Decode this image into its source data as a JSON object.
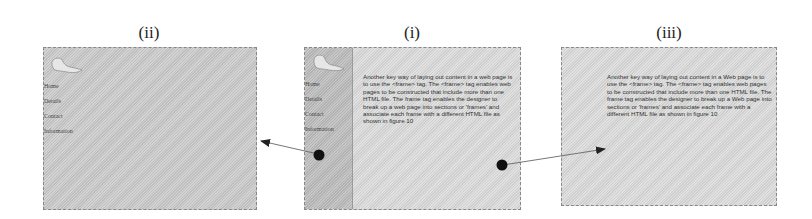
{
  "figure": {
    "panels": [
      {
        "id": "ii",
        "label": "(ii)",
        "nav_links": [
          "Home",
          "Details",
          "Contact",
          "Information"
        ]
      },
      {
        "id": "i",
        "label": "(i)",
        "nav_links": [
          "Home",
          "Details",
          "Contact",
          "Information"
        ],
        "body_text": "Another key way of laying out content in a web page is to use the <frame> tag. The <frame> tag enables web pages to be constructed that include more than one HTML file. The frame tag enables the designer to break up a web page into sections or 'frames' and associate each frame with a different HTML file as shown in figure 10"
      },
      {
        "id": "iii",
        "label": "(iii)",
        "body_text": "Another key way of laying out content in a Web page is to use the <frame> tag. The <frame> tag enables web pages to be constructed that include more than one HTML file. The frame tag enables the designer to break up a Web page into sections or 'frames' and associate each frame with a different HTML file as shown in figure 10"
      }
    ],
    "arrows": [
      {
        "from": "i.nav-frame",
        "to": "ii"
      },
      {
        "from": "i.content-frame",
        "to": "iii"
      }
    ],
    "colors": {
      "panel_bg": "#c9c9c9",
      "panel_light_bg": "#dadada",
      "nav_frame_bg": "#bdbdbd",
      "arrow": "#333333"
    }
  }
}
